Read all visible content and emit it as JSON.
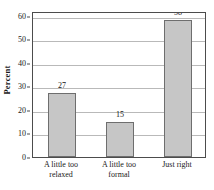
{
  "chart_data": {
    "type": "bar",
    "title": "",
    "subtitle": "",
    "xlabel": "",
    "ylabel": "Percent",
    "categories": [
      "A little too relaxed",
      "A little too formal",
      "Just right"
    ],
    "category_lines": [
      [
        "A little too",
        "relaxed"
      ],
      [
        "A little too",
        "formal"
      ],
      [
        "Just right"
      ]
    ],
    "values": [
      27,
      15,
      58
    ],
    "value_labels": [
      "27",
      "15",
      "58"
    ],
    "ylim": [
      0,
      62
    ],
    "yticks": [
      0,
      10,
      20,
      30,
      40,
      50,
      60
    ],
    "ytick_labels": [
      "0",
      "10",
      "20",
      "30",
      "40",
      "50",
      "60"
    ],
    "grid": "horizontal",
    "legend": "none",
    "annotations": []
  },
  "style": {
    "bar_fill": "#c6c6c6",
    "bar_stroke": "#6e6e6e",
    "grid_color": "#b9b9b9",
    "axis_color": "#4c4c4c",
    "text_color": "#141414",
    "background": "#ffffff"
  }
}
